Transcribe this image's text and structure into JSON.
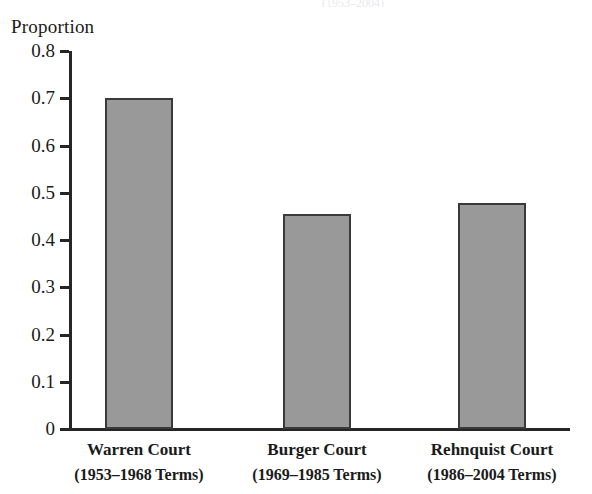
{
  "figure": {
    "top_clipped_text": "(1953–2004)",
    "background_color": "#ffffff",
    "axis_color": "#262626",
    "bar_fill_color": "#999999",
    "bar_border_color": "#3a3a3a"
  },
  "chart_data": {
    "type": "bar",
    "title": "",
    "subtitle": "",
    "xlabel": "",
    "ylabel": "Proportion",
    "ylim": [
      0,
      0.8
    ],
    "grid": false,
    "legend": "none",
    "yticks": [
      "0.8",
      "0.7",
      "0.6",
      "0.5",
      "0.4",
      "0.3",
      "0.2",
      "0.1",
      "0"
    ],
    "ytick_values": [
      0.8,
      0.7,
      0.6,
      0.5,
      0.4,
      0.3,
      0.2,
      0.1,
      0
    ],
    "categories": [
      "Warren Court (1953–1968 Terms)",
      "Burger Court (1969–1985 Terms)",
      "Rehnquist Court (1986–2004 Terms)"
    ],
    "category_lines": [
      {
        "line1": "Warren Court",
        "line2": "(1953–1968 Terms)"
      },
      {
        "line1": "Burger Court",
        "line2": "(1969–1985 Terms)"
      },
      {
        "line1": "Rehnquist Court",
        "line2": "(1986–2004 Terms)"
      }
    ],
    "values": [
      0.7,
      0.455,
      0.478
    ]
  }
}
